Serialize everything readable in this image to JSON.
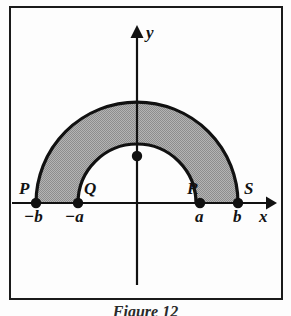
{
  "figure": {
    "caption": "Figure 12",
    "axes": {
      "x_label": "x",
      "y_label": "y",
      "origin_px": [
        137,
        203
      ]
    },
    "point_labels": [
      {
        "name": "P",
        "label": "P",
        "tick": "−b",
        "x_px": 36
      },
      {
        "name": "Q",
        "label": "Q",
        "tick": "−a",
        "x_px": 78
      },
      {
        "name": "R",
        "label": "R",
        "tick": "a",
        "x_px": 200
      },
      {
        "name": "S",
        "label": "S",
        "tick": "b",
        "x_px": 238
      }
    ],
    "region": {
      "shape": "half-annulus",
      "inner_radius_px": 59,
      "outer_radius_px": 101,
      "fill_color": "#a9a9a9",
      "stroke_color": "#111111"
    },
    "colors": {
      "ink": "#111111",
      "paper": "#fdfdfd",
      "shade": "#a9a9a9",
      "frame": "#1b1b1b"
    }
  }
}
